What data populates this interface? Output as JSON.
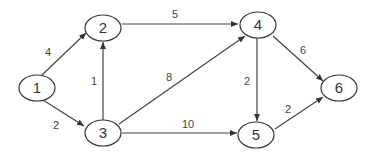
{
  "diagram": {
    "type": "directed-weighted-graph",
    "nodes": [
      {
        "id": "1",
        "label": "1",
        "cx": 37,
        "cy": 88
      },
      {
        "id": "2",
        "label": "2",
        "cx": 103,
        "cy": 28
      },
      {
        "id": "3",
        "label": "3",
        "cx": 103,
        "cy": 133
      },
      {
        "id": "4",
        "label": "4",
        "cx": 258,
        "cy": 25
      },
      {
        "id": "5",
        "label": "5",
        "cx": 255,
        "cy": 135
      },
      {
        "id": "6",
        "label": "6",
        "cx": 339,
        "cy": 88
      }
    ],
    "edges": [
      {
        "from": "1",
        "to": "2",
        "weight": "4"
      },
      {
        "from": "1",
        "to": "3",
        "weight": "2"
      },
      {
        "from": "3",
        "to": "2",
        "weight": "1"
      },
      {
        "from": "2",
        "to": "4",
        "weight": "5"
      },
      {
        "from": "3",
        "to": "4",
        "weight": "8"
      },
      {
        "from": "3",
        "to": "5",
        "weight": "10"
      },
      {
        "from": "4",
        "to": "5",
        "weight": "2"
      },
      {
        "from": "4",
        "to": "6",
        "weight": "6"
      },
      {
        "from": "5",
        "to": "6",
        "weight": "2"
      }
    ]
  },
  "style": {
    "line_color": "#444444",
    "node_stroke": "#333333",
    "node_fill": "#ffffff"
  }
}
